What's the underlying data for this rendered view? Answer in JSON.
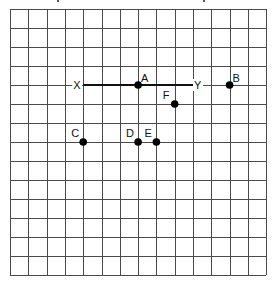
{
  "diagram": {
    "type": "grid-coordinate-diagram",
    "grid": {
      "columns": 14,
      "rows": 14,
      "origin_x": 10,
      "origin_y": 9,
      "cell_width": 18.3,
      "cell_height": 19,
      "line_color": "#4a4a4a"
    },
    "segment": {
      "from": "X",
      "to": "Y",
      "color": "#111111"
    },
    "labels": {
      "X": "X",
      "Y": "Y",
      "A": "A",
      "B": "B",
      "C": "C",
      "D": "D",
      "E": "E",
      "F": "F"
    },
    "points": [
      {
        "id": "X",
        "label": "X",
        "col": 4,
        "row": 4,
        "dot": false,
        "label_pos": "left"
      },
      {
        "id": "A",
        "label": "A",
        "col": 7,
        "row": 4,
        "dot": true,
        "label_pos": "upper-right"
      },
      {
        "id": "Y",
        "label": "Y",
        "col": 10,
        "row": 4,
        "dot": false,
        "label_pos": "right"
      },
      {
        "id": "B",
        "label": "B",
        "col": 12,
        "row": 4,
        "dot": true,
        "label_pos": "upper-right"
      },
      {
        "id": "F",
        "label": "F",
        "col": 9,
        "row": 5,
        "dot": true,
        "label_pos": "upper-left"
      },
      {
        "id": "C",
        "label": "C",
        "col": 4,
        "row": 7,
        "dot": true,
        "label_pos": "upper-left"
      },
      {
        "id": "D",
        "label": "D",
        "col": 7,
        "row": 7,
        "dot": true,
        "label_pos": "upper-left"
      },
      {
        "id": "E",
        "label": "E",
        "col": 8,
        "row": 7,
        "dot": true,
        "label_pos": "upper-left"
      }
    ]
  }
}
